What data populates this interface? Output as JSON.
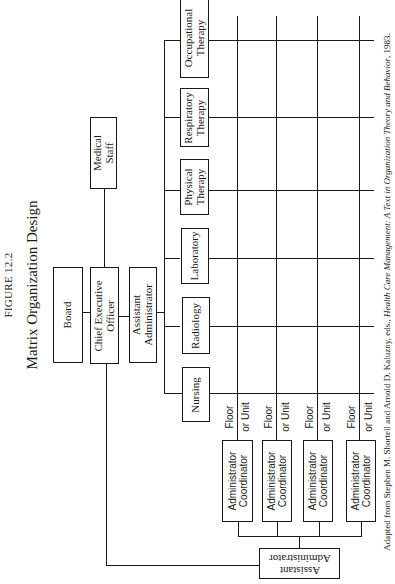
{
  "figure": {
    "label": "FIGURE 12.2",
    "title": "Matrix Organization Design"
  },
  "executive": {
    "board": "Board",
    "ceo_line1": "Chief Executive",
    "ceo_line2": "Officer",
    "asst_admin_line1": "Assistant",
    "asst_admin_line2": "Administrator",
    "medical_staff_line1": "Medical",
    "medical_staff_line2": "Staff"
  },
  "departments": [
    {
      "line1": "Nursing",
      "line2": ""
    },
    {
      "line1": "Radiology",
      "line2": ""
    },
    {
      "line1": "Laboratory",
      "line2": ""
    },
    {
      "line1": "Physical",
      "line2": "Therapy"
    },
    {
      "line1": "Respiratory",
      "line2": "Therapy"
    },
    {
      "line1": "Occupational",
      "line2": "Therapy"
    }
  ],
  "units": [
    {
      "floor": "Floor",
      "unit": "or Unit",
      "coord_line1": "Administrator",
      "coord_line2": "Coordinator"
    },
    {
      "floor": "Floor",
      "unit": "or Unit",
      "coord_line1": "Administrator",
      "coord_line2": "Coordinator"
    },
    {
      "floor": "Floor",
      "unit": "or Unit",
      "coord_line1": "Administrator",
      "coord_line2": "Coordinator"
    },
    {
      "floor": "Floor",
      "unit": "or Unit",
      "coord_line1": "Administrator",
      "coord_line2": "Coordinator"
    }
  ],
  "bottom_asst_admin": {
    "line1": "Assistant",
    "line2": "Administrator"
  },
  "source": {
    "prefix": "Adapted from Stephen M. Shortell and Arnold D. Kaluzny, eds., ",
    "title": "Health Care Management: A Text in Organization Theory and Behavior",
    "suffix": ", 1983."
  }
}
